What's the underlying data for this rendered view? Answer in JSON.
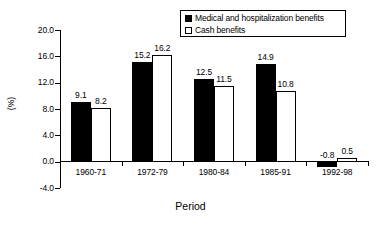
{
  "chart_data": {
    "type": "bar",
    "title": "",
    "subtitle": "",
    "xlabel": "Period",
    "ylabel": "(%)",
    "categories": [
      "1960-71",
      "1972-79",
      "1980-84",
      "1985-91",
      "1992-98"
    ],
    "series": [
      {
        "name": "Medical and hospitalization benefits",
        "color": "#000000",
        "style": "filled",
        "values": [
          9.1,
          15.2,
          12.5,
          14.9,
          -0.8
        ],
        "labels": [
          "9.1",
          "15.2",
          "12.5",
          "14.9",
          "-0.8"
        ]
      },
      {
        "name": "Cash benefits",
        "color": "#ffffff",
        "style": "hollow",
        "values": [
          8.2,
          16.2,
          11.5,
          10.8,
          0.5
        ],
        "labels": [
          "8.2",
          "16.2",
          "11.5",
          "10.8",
          "0.5"
        ]
      }
    ],
    "ylim": [
      -4.0,
      20.0
    ],
    "ytick_step": 4.0,
    "yticks": [
      20.0,
      16.0,
      12.0,
      8.0,
      4.0,
      0.0,
      -4.0
    ],
    "ytick_labels": [
      "20.0",
      "16.0",
      "12.0",
      "8.0",
      "4.0",
      "0.0",
      "-4.0"
    ],
    "grid": false,
    "legend_position": "top-right",
    "legend_entries": [
      "Medical and hospitalization benefits",
      "Cash benefits"
    ]
  }
}
